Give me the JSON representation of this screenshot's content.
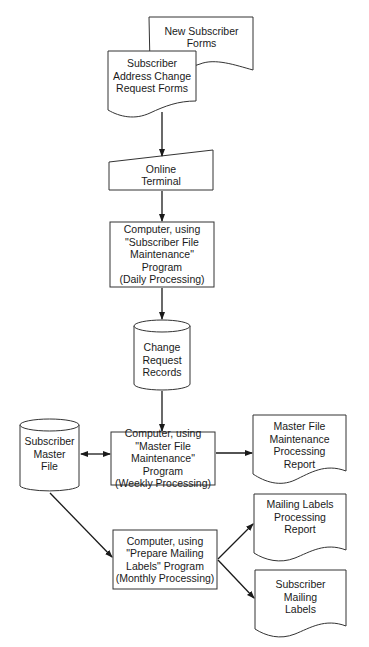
{
  "diagram": {
    "type": "system-flowchart",
    "nodes": [
      {
        "id": "new_forms",
        "shape": "document",
        "lines": [
          "New Subscriber",
          "Forms"
        ]
      },
      {
        "id": "change_forms",
        "shape": "document",
        "lines": [
          "Subscriber",
          "Address Change",
          "Request Forms"
        ]
      },
      {
        "id": "terminal",
        "shape": "manual-input",
        "lines": [
          "Online",
          "Terminal"
        ]
      },
      {
        "id": "daily",
        "shape": "process",
        "lines": [
          "Computer, using",
          "\"Subscriber File",
          "Maintenance\"",
          "Program",
          "(Daily Processing)"
        ]
      },
      {
        "id": "change_records",
        "shape": "database",
        "lines": [
          "Change",
          "Request",
          "Records"
        ]
      },
      {
        "id": "master_file",
        "shape": "database",
        "lines": [
          "Subscriber",
          "Master",
          "File"
        ]
      },
      {
        "id": "weekly",
        "shape": "process",
        "lines": [
          "Computer, using",
          "\"Master File",
          "Maintenance\"",
          "Program",
          "(Weekly Processing)"
        ]
      },
      {
        "id": "maint_report",
        "shape": "document",
        "lines": [
          "Master File",
          "Maintenance",
          "Processing",
          "Report"
        ]
      },
      {
        "id": "monthly",
        "shape": "process",
        "lines": [
          "Computer, using",
          "\"Prepare Mailing",
          "Labels\" Program",
          "(Monthly Processing)"
        ]
      },
      {
        "id": "labels_report",
        "shape": "document",
        "lines": [
          "Mailing Labels",
          "Processing",
          "Report"
        ]
      },
      {
        "id": "mailing_labels",
        "shape": "document",
        "lines": [
          "Subscriber",
          "Mailing",
          "Labels"
        ]
      }
    ],
    "edges": [
      {
        "from": "change_forms",
        "to": "terminal"
      },
      {
        "from": "terminal",
        "to": "daily"
      },
      {
        "from": "daily",
        "to": "change_records"
      },
      {
        "from": "change_records",
        "to": "weekly"
      },
      {
        "from": "master_file",
        "to": "weekly",
        "bidirectional": true
      },
      {
        "from": "weekly",
        "to": "maint_report"
      },
      {
        "from": "master_file",
        "to": "monthly"
      },
      {
        "from": "monthly",
        "to": "labels_report"
      },
      {
        "from": "monthly",
        "to": "mailing_labels"
      }
    ]
  }
}
